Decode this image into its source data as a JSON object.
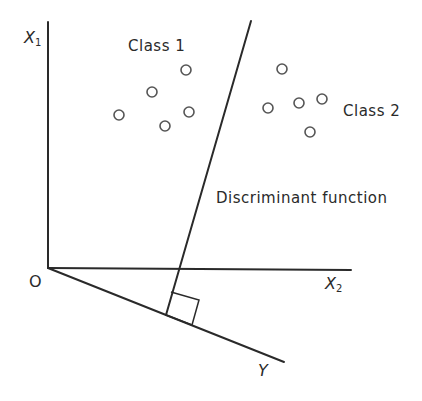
{
  "diagram": {
    "labels": {
      "class1": "Class 1",
      "class2": "Class 2",
      "discriminant": "Discriminant function",
      "origin": "O",
      "x1_var": "X",
      "x1_sub": "1",
      "x2_var": "X",
      "x2_sub": "2",
      "y_axis": "Y"
    },
    "stroke_color": "#2a2a2a",
    "point_color": "#555555",
    "axes": {
      "origin": [
        48,
        268
      ],
      "x1_end": [
        48,
        22
      ],
      "x2_end": [
        351,
        270
      ],
      "y_end": [
        284,
        362
      ]
    },
    "discriminant_line": {
      "start": [
        251,
        21
      ],
      "end": [
        166,
        315
      ]
    },
    "right_angle_marker": [
      [
        171,
        292
      ],
      [
        199,
        300
      ],
      [
        192,
        325
      ],
      [
        166,
        315
      ]
    ],
    "class1_points": [
      [
        186,
        70
      ],
      [
        152,
        92
      ],
      [
        119,
        115
      ],
      [
        189,
        112
      ],
      [
        165,
        126
      ]
    ],
    "class2_points": [
      [
        282,
        69
      ],
      [
        268,
        108
      ],
      [
        299,
        103
      ],
      [
        322,
        99
      ],
      [
        310,
        132
      ]
    ]
  }
}
